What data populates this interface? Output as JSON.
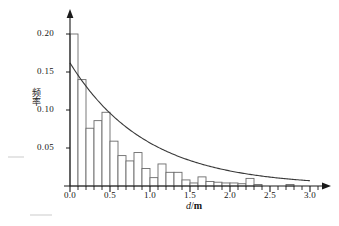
{
  "chart_data": {
    "type": "bar",
    "title": "",
    "subtitle": "",
    "xlabel": "d/m",
    "xlabel_variable": "d",
    "xlabel_separator": "/",
    "xlabel_unit": "m",
    "ylabel": "频率",
    "xlim": [
      0.0,
      3.1
    ],
    "ylim": [
      0.0,
      0.21
    ],
    "grid": false,
    "legend": null,
    "bin_width": 0.1,
    "x_tick_labels": [
      "0.0",
      "0.5",
      "1.0",
      "1.5",
      "2.0",
      "2.5",
      "3.0"
    ],
    "x_tick_values": [
      0.0,
      0.5,
      1.0,
      1.5,
      2.0,
      2.5,
      3.0
    ],
    "x_minor_tick_step": 0.1,
    "y_tick_labels": [
      "0.05",
      "0.10",
      "0.15",
      "0.20"
    ],
    "y_tick_values": [
      0.05,
      0.1,
      0.15,
      0.2
    ],
    "bin_starts": [
      0.0,
      0.1,
      0.2,
      0.3,
      0.4,
      0.5,
      0.6,
      0.7,
      0.8,
      0.9,
      1.0,
      1.1,
      1.2,
      1.3,
      1.4,
      1.5,
      1.6,
      1.7,
      1.8,
      1.9,
      2.0,
      2.1,
      2.2,
      2.3,
      2.4,
      2.5,
      2.6,
      2.7,
      2.8,
      2.9
    ],
    "values": [
      0.2,
      0.14,
      0.076,
      0.086,
      0.097,
      0.059,
      0.04,
      0.033,
      0.044,
      0.023,
      0.011,
      0.029,
      0.018,
      0.018,
      0.008,
      0.004,
      0.012,
      0.006,
      0.005,
      0.004,
      0.004,
      0.003,
      0.01,
      0.002,
      0.0,
      0.0,
      0.0,
      0.002,
      0.0,
      0.0
    ],
    "series": [
      {
        "name": "frequency-histogram",
        "type": "bar",
        "values": [
          0.2,
          0.14,
          0.076,
          0.086,
          0.097,
          0.059,
          0.04,
          0.033,
          0.044,
          0.023,
          0.011,
          0.029,
          0.018,
          0.018,
          0.008,
          0.004,
          0.012,
          0.006,
          0.005,
          0.004,
          0.004,
          0.003,
          0.01,
          0.002,
          0.0,
          0.0,
          0.0,
          0.002,
          0.0,
          0.0
        ]
      },
      {
        "name": "fitted-exponential-curve",
        "type": "line",
        "amplitude": 0.162,
        "decay_rate": 1.05,
        "x_start": 0.0,
        "x_end": 3.0,
        "y_start": 0.162,
        "y_end": 0.007
      }
    ]
  },
  "axes": {
    "x_title_variable": "d",
    "x_title_separator": "/",
    "x_title_unit": "m",
    "y_title": "频率"
  },
  "ticks": {
    "y": [
      {
        "label": "0.20",
        "value": 0.2
      },
      {
        "label": "0.15",
        "value": 0.15
      },
      {
        "label": "0.10",
        "value": 0.1
      },
      {
        "label": "0.05",
        "value": 0.05
      }
    ],
    "x": [
      {
        "label": "0.0",
        "value": 0.0
      },
      {
        "label": "0.5",
        "value": 0.5
      },
      {
        "label": "1.0",
        "value": 1.0
      },
      {
        "label": "1.5",
        "value": 1.5
      },
      {
        "label": "2.0",
        "value": 2.0
      },
      {
        "label": "2.5",
        "value": 2.5
      },
      {
        "label": "3.0",
        "value": 3.0
      }
    ]
  },
  "colors": {
    "axis": "#1a1a1a",
    "bar_stroke": "#6b6b6b",
    "bar_fill": "#ffffff",
    "curve": "#3a3a3a",
    "text": "#141414",
    "background": "#ffffff"
  }
}
